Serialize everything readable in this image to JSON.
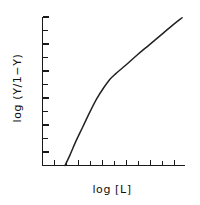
{
  "chart_data": {
    "type": "line",
    "title": "",
    "subtitle": "",
    "xlabel": "log [L]",
    "ylabel": "log (Y/1−Y)",
    "grid": false,
    "legend": null,
    "xlim": [
      0,
      12
    ],
    "ylim": [
      0,
      12
    ],
    "x_tick_count": 12,
    "y_tick_count": 12,
    "x_tick_labels": [],
    "y_tick_labels": [],
    "series": [
      {
        "name": "Hill plot",
        "x": [
          1.9,
          2.3,
          2.8,
          3.4,
          4.0,
          4.6,
          5.2,
          5.7,
          6.2,
          7.0,
          8.0,
          9.0,
          10.0,
          11.0,
          11.8
        ],
        "y": [
          0.0,
          0.8,
          1.9,
          3.1,
          4.3,
          5.4,
          6.3,
          6.95,
          7.4,
          8.05,
          8.9,
          9.7,
          10.5,
          11.3,
          11.9
        ]
      }
    ],
    "annotations": [],
    "colors": {
      "curve": "#222222",
      "axis": "#1a1a1a",
      "background": "#ffffff",
      "text": "#111111"
    }
  }
}
